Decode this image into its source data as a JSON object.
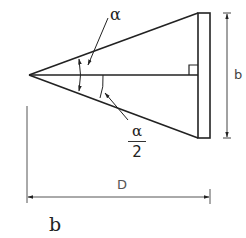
{
  "diagram": {
    "labels": {
      "apex_angle": "α",
      "half_angle_numerator": "α",
      "half_angle_denominator": "2",
      "height_dimension": "b",
      "length_dimension": "D",
      "caption": "b"
    },
    "colors": {
      "stroke": "#222222",
      "dimension_stroke": "#555555",
      "background": "#ffffff"
    }
  }
}
